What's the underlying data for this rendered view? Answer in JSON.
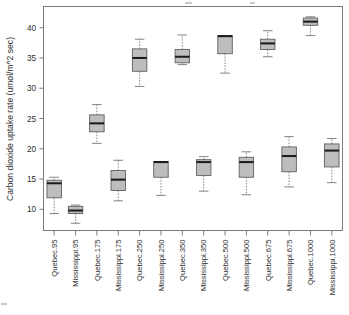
{
  "chart_data": {
    "type": "boxplot",
    "title": "",
    "xlabel": "",
    "ylabel": "Carbon dioxide uptake rate (umol/m^2 sec)",
    "ylim": [
      6.5,
      43.5
    ],
    "yticks": [
      10,
      15,
      20,
      25,
      30,
      35,
      40
    ],
    "ytick_labels": [
      "10",
      "15",
      "20",
      "25",
      "30",
      "35",
      "40"
    ],
    "grid": false,
    "legend": "none",
    "box_fill_color": "#bdbdbd",
    "box_border_color": "#5a5a5a",
    "median_color": "#1a1a1a",
    "whisker_color": "#6e6e6e",
    "categories": [
      "Quebec.95",
      "Mississippi.95",
      "Quebec.175",
      "Mississippi.175",
      "Quebec.250",
      "Mississippi.250",
      "Quebec.350",
      "Mississippi.350",
      "Quebec.500",
      "Mississippi.500",
      "Quebec.675",
      "Mississippi.675",
      "Quebec.1000",
      "Mississippi.1000"
    ],
    "boxes": [
      {
        "category": "Quebec.95",
        "whisker_low": 9.3,
        "q1": 11.9,
        "median": 14.3,
        "q3": 14.8,
        "whisker_high": 15.3
      },
      {
        "category": "Mississippi.95",
        "whisker_low": 7.7,
        "q1": 9.3,
        "median": 9.8,
        "q3": 10.5,
        "whisker_high": 10.7
      },
      {
        "category": "Quebec.175",
        "whisker_low": 20.9,
        "q1": 22.8,
        "median": 24.2,
        "q3": 25.6,
        "whisker_high": 27.3
      },
      {
        "category": "Mississippi.175",
        "whisker_low": 11.4,
        "q1": 13.1,
        "median": 14.9,
        "q3": 16.4,
        "whisker_high": 18.1
      },
      {
        "category": "Quebec.250",
        "whisker_low": 30.3,
        "q1": 32.8,
        "median": 35.0,
        "q3": 36.5,
        "whisker_high": 38.1
      },
      {
        "category": "Mississippi.250",
        "whisker_low": 12.3,
        "q1": 15.3,
        "median": 17.8,
        "q3": 17.9,
        "whisker_high": 17.9
      },
      {
        "category": "Quebec.350",
        "whisker_low": 33.9,
        "q1": 34.2,
        "median": 35.2,
        "q3": 36.4,
        "whisker_high": 38.8
      },
      {
        "category": "Mississippi.350",
        "whisker_low": 13.0,
        "q1": 15.6,
        "median": 17.8,
        "q3": 18.2,
        "whisker_high": 18.7
      },
      {
        "category": "Quebec.500",
        "whisker_low": 32.5,
        "q1": 35.7,
        "median": 38.6,
        "q3": 38.7,
        "whisker_high": 38.7
      },
      {
        "category": "Mississippi.500",
        "whisker_low": 12.4,
        "q1": 15.3,
        "median": 17.8,
        "q3": 18.6,
        "whisker_high": 19.5
      },
      {
        "category": "Quebec.675",
        "whisker_low": 35.2,
        "q1": 36.4,
        "median": 37.4,
        "q3": 38.1,
        "whisker_high": 39.5
      },
      {
        "category": "Mississippi.675",
        "whisker_low": 13.7,
        "q1": 16.2,
        "median": 18.8,
        "q3": 20.3,
        "whisker_high": 22.0
      },
      {
        "category": "Quebec.1000",
        "whisker_low": 38.7,
        "q1": 40.4,
        "median": 41.0,
        "q3": 41.6,
        "whisker_high": 41.8
      },
      {
        "category": "Mississippi.1000",
        "whisker_low": 14.4,
        "q1": 17.0,
        "median": 19.7,
        "q3": 20.8,
        "whisker_high": 21.7
      }
    ]
  }
}
